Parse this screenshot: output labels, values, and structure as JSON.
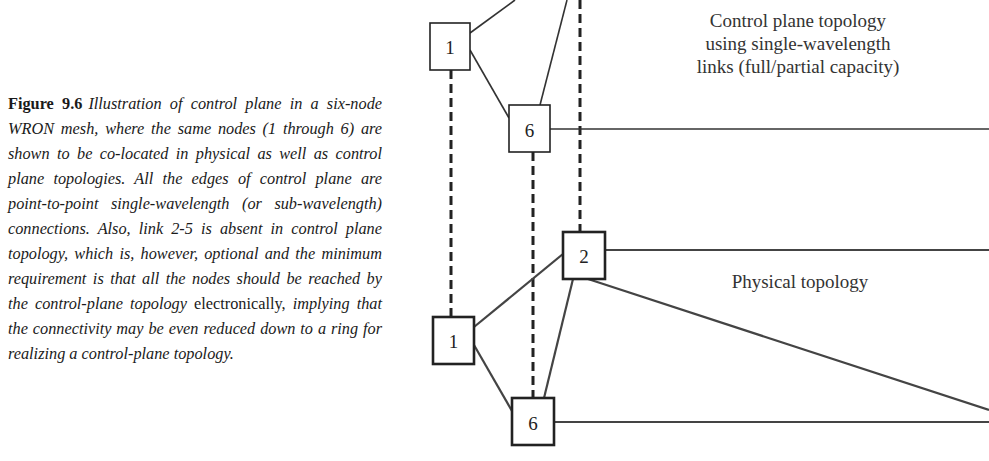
{
  "caption": {
    "figure_label": "Figure 9.6",
    "text_part1": "Illustration of control plane in a six-node WRON mesh, where the same nodes (1 through 6) are shown to be co-located in physical as well as control plane topologies. All the edges of control plane are point-to-point single-wavelength (or sub-wavelength) connections. Also, link 2-5 is absent in control plane topology, which is, however, optional and the minimum requirement is that all the nodes should be reached by the control-plane topology",
    "text_upright": " electronically, ",
    "text_part2": "implying that the connectivity may be even reduced down to a ring for realizing a control-plane topology."
  },
  "diagram": {
    "control_plane": {
      "label_lines": [
        "Control plane topology",
        "using single-wavelength",
        "links (full/partial capacity)"
      ],
      "nodes": [
        {
          "id": "1",
          "label": "1"
        },
        {
          "id": "6",
          "label": "6"
        }
      ]
    },
    "physical": {
      "label": "Physical topology",
      "nodes": [
        {
          "id": "2",
          "label": "2"
        },
        {
          "id": "1",
          "label": "1"
        },
        {
          "id": "6",
          "label": "6"
        }
      ]
    }
  }
}
